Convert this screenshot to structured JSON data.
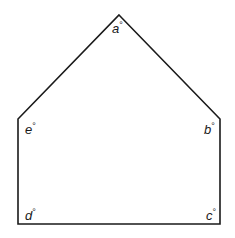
{
  "diagram": {
    "type": "pentagon",
    "stroke_color": "#1a1a1a",
    "fill_color": "#ffffff",
    "vertices": [
      {
        "id": "a",
        "x": 119,
        "y": 15
      },
      {
        "id": "b",
        "x": 220,
        "y": 119
      },
      {
        "id": "c",
        "x": 220,
        "y": 224
      },
      {
        "id": "d",
        "x": 18,
        "y": 224
      },
      {
        "id": "e",
        "x": 18,
        "y": 119
      }
    ],
    "labels": {
      "a": {
        "letter": "a",
        "degree": "°"
      },
      "b": {
        "letter": "b",
        "degree": "°"
      },
      "c": {
        "letter": "c",
        "degree": "°"
      },
      "d": {
        "letter": "d",
        "degree": "°"
      },
      "e": {
        "letter": "e",
        "degree": "°"
      }
    }
  }
}
